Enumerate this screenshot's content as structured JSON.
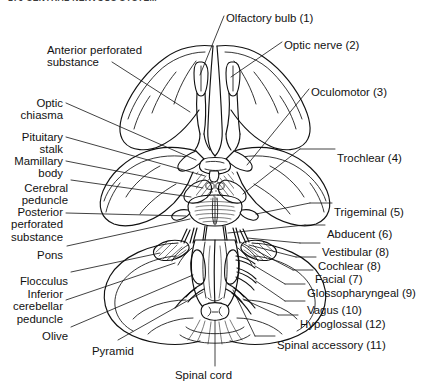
{
  "page": {
    "running_head": "176      CENTRAL NERVOUS SYSTEM",
    "figure_title": "Inferior surface of the brain showing the cranial nerves",
    "ink_color": "#111111",
    "background_color": "#ffffff"
  },
  "labels_left": [
    {
      "id": "anterior-perforated-substance",
      "text": "Anterior perforated\nsubstance",
      "x": 47,
      "y": 44,
      "align": "left"
    },
    {
      "id": "optic-chiasma",
      "text": "Optic\nchiasma",
      "x": 63,
      "y": 97,
      "align": "right"
    },
    {
      "id": "pituitary-stalk",
      "text": "Pituitary\nstalk",
      "x": 63,
      "y": 131,
      "align": "right"
    },
    {
      "id": "mamillary-body",
      "text": "Mamillary\nbody",
      "x": 63,
      "y": 155,
      "align": "right"
    },
    {
      "id": "cerebral-peduncle",
      "text": "Cerebral\npeduncle",
      "x": 68,
      "y": 182,
      "align": "right"
    },
    {
      "id": "posterior-perforated-substance",
      "text": "Posterior\nperforated\nsubstance",
      "x": 63,
      "y": 206,
      "align": "right"
    },
    {
      "id": "pons",
      "text": "Pons",
      "x": 63,
      "y": 249,
      "align": "right"
    },
    {
      "id": "flocculus",
      "text": "Flocculus",
      "x": 68,
      "y": 275,
      "align": "right"
    },
    {
      "id": "inferior-cerebellar-peduncle",
      "text": "Inferior\ncerebellar\npeduncle",
      "x": 63,
      "y": 288,
      "align": "right"
    },
    {
      "id": "olive",
      "text": "Olive",
      "x": 68,
      "y": 330,
      "align": "right"
    }
  ],
  "labels_right": [
    {
      "id": "olfactory-bulb",
      "text": "Olfactory bulb (1)",
      "x": 226,
      "y": 12,
      "align": "left"
    },
    {
      "id": "optic-nerve",
      "text": "Optic nerve (2)",
      "x": 284,
      "y": 39,
      "align": "left"
    },
    {
      "id": "oculomotor",
      "text": "Oculomotor (3)",
      "x": 311,
      "y": 86,
      "align": "left"
    },
    {
      "id": "trochlear",
      "text": "Trochlear (4)",
      "x": 337,
      "y": 152,
      "align": "left"
    },
    {
      "id": "trigeminal",
      "text": "Trigeminal (5)",
      "x": 334,
      "y": 206,
      "align": "left"
    },
    {
      "id": "abducent",
      "text": "Abducent (6)",
      "x": 327,
      "y": 228,
      "align": "left"
    },
    {
      "id": "vestibular",
      "text": "Vestibular (8)",
      "x": 322,
      "y": 246,
      "align": "left"
    },
    {
      "id": "cochlear",
      "text": "Cochlear (8)",
      "x": 318,
      "y": 260,
      "align": "left"
    },
    {
      "id": "facial",
      "text": "Facial (7)",
      "x": 315,
      "y": 273,
      "align": "left"
    },
    {
      "id": "glossopharyngeal",
      "text": "Glossopharyngeal (9)",
      "x": 307,
      "y": 287,
      "align": "left"
    },
    {
      "id": "vagus",
      "text": "Vagus (10)",
      "x": 307,
      "y": 304,
      "align": "left"
    },
    {
      "id": "hypoglossal",
      "text": "Hypoglossal (12)",
      "x": 300,
      "y": 318,
      "align": "left"
    },
    {
      "id": "spinal-accessory",
      "text": "Spinal accessory (11)",
      "x": 277,
      "y": 339,
      "align": "left"
    }
  ],
  "labels_bottom": [
    {
      "id": "pyramid",
      "text": "Pyramid",
      "x": 92,
      "y": 345,
      "align": "left"
    },
    {
      "id": "spinal-cord",
      "text": "Spinal cord",
      "x": 175,
      "y": 369,
      "align": "left"
    }
  ],
  "structures": [
    "frontal-lobe-left",
    "frontal-lobe-right",
    "longitudinal-fissure",
    "olfactory-bulb",
    "olfactory-tract",
    "optic-nerve",
    "optic-chiasma",
    "pituitary-stalk",
    "mamillary-body",
    "cerebral-peduncle",
    "anterior-perforated-substance",
    "posterior-perforated-substance",
    "temporal-pole-left",
    "temporal-pole-right",
    "uncus",
    "pons",
    "trigeminal-nerve",
    "abducent-nerve",
    "facial-nerve",
    "vestibulocochlear-nerve",
    "flocculus",
    "inferior-cerebellar-peduncle",
    "cerebellar-hemisphere-left",
    "cerebellar-hemisphere-right",
    "medulla-oblongata",
    "pyramid",
    "olive",
    "glossopharyngeal-nerve",
    "vagus-nerve",
    "spinal-accessory-nerve",
    "hypoglossal-nerve",
    "spinal-cord"
  ]
}
